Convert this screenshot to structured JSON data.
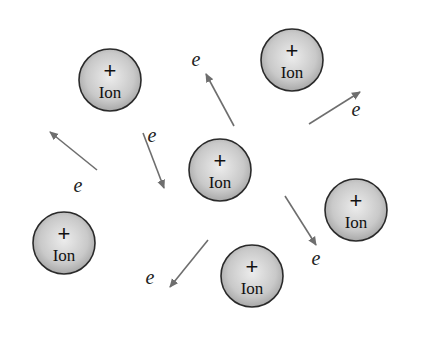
{
  "diagram": {
    "ion": {
      "symbol": "+",
      "label": "Ion",
      "radius": 31,
      "fill_light": "#ececec",
      "fill_dark": "#a8a8a8",
      "stroke": "#2a2a2a"
    },
    "electron_label": "e",
    "arrow_color": "#6e6e6e",
    "ions": [
      {
        "id": "ion-top-left",
        "cx": 110,
        "cy": 80
      },
      {
        "id": "ion-top-right",
        "cx": 292,
        "cy": 60
      },
      {
        "id": "ion-center",
        "cx": 220,
        "cy": 170
      },
      {
        "id": "ion-right",
        "cx": 356,
        "cy": 210
      },
      {
        "id": "ion-bottom-left",
        "cx": 64,
        "cy": 243
      },
      {
        "id": "ion-bottom-center",
        "cx": 252,
        "cy": 276
      }
    ],
    "electrons": [
      {
        "id": "electron-top-center",
        "x1": 234,
        "y1": 126,
        "x2": 206,
        "y2": 74,
        "lx": 196,
        "ly": 66
      },
      {
        "id": "electron-top-right",
        "x1": 309,
        "y1": 124,
        "x2": 360,
        "y2": 92,
        "lx": 356,
        "ly": 116
      },
      {
        "id": "electron-left",
        "x1": 97,
        "y1": 170,
        "x2": 50,
        "y2": 132,
        "lx": 78,
        "ly": 192
      },
      {
        "id": "electron-center-left",
        "x1": 143,
        "y1": 133,
        "x2": 164,
        "y2": 188,
        "lx": 152,
        "ly": 142
      },
      {
        "id": "electron-center-right",
        "x1": 285,
        "y1": 196,
        "x2": 316,
        "y2": 245,
        "lx": 316,
        "ly": 265
      },
      {
        "id": "electron-bottom-left",
        "x1": 208,
        "y1": 240,
        "x2": 170,
        "y2": 287,
        "lx": 150,
        "ly": 284
      }
    ]
  }
}
